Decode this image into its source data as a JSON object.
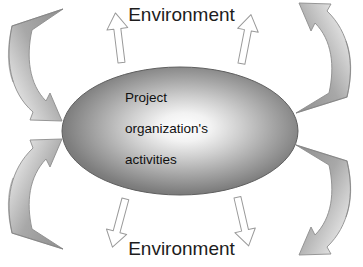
{
  "diagram": {
    "labels": {
      "environment_top": "Environment",
      "environment_bottom": "Environment"
    },
    "core": {
      "shape": "ellipse",
      "lines": [
        "Project",
        "organization's",
        "activities"
      ]
    },
    "colors": {
      "background": "#ffffff",
      "ellipse_center": "#ffffff",
      "ellipse_mid": "#b7b7b7",
      "ellipse_edge": "#6f6f6f",
      "ellipse_outline": "#5a5a5a",
      "arrow_fill": "#ffffff",
      "arrow_outline": "#8d8d8d",
      "curved_arrow_tail": "#9b9b9b",
      "curved_arrow_tail_dark": "#808080",
      "text": "#161616"
    },
    "straight_arrows": [
      {
        "name": "arrow-up-left",
        "direction": "up",
        "position": "top-left-of-ellipse"
      },
      {
        "name": "arrow-up-right",
        "direction": "up",
        "position": "top-right-of-ellipse"
      },
      {
        "name": "arrow-down-left",
        "direction": "down",
        "position": "bottom-left-of-ellipse"
      },
      {
        "name": "arrow-down-right",
        "direction": "down",
        "position": "bottom-right-of-ellipse"
      }
    ],
    "curved_arrows": [
      {
        "name": "curved-arrow-top-left",
        "direction": "inward",
        "corner": "top-left"
      },
      {
        "name": "curved-arrow-bottom-left",
        "direction": "inward",
        "corner": "bottom-left"
      },
      {
        "name": "curved-arrow-top-right",
        "direction": "outward",
        "corner": "top-right"
      },
      {
        "name": "curved-arrow-bottom-right",
        "direction": "outward",
        "corner": "bottom-right"
      }
    ]
  }
}
